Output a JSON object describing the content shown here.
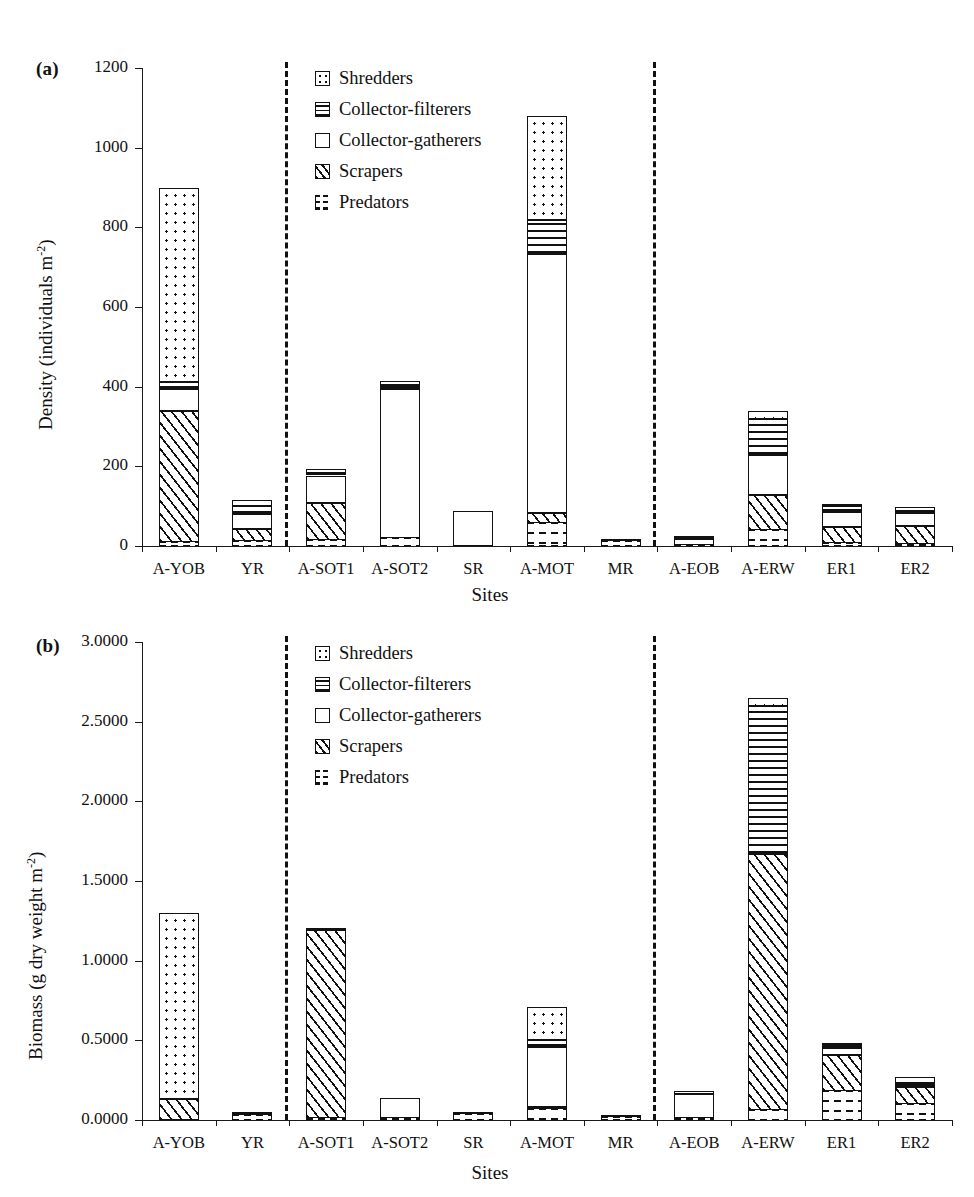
{
  "figure": {
    "panels": [
      {
        "letter": "(a)",
        "ylabel_main": "Density (individuals m",
        "ylabel_sup": "-2",
        "ylabel_close": ")",
        "xlabel": "Sites"
      },
      {
        "letter": "(b)",
        "ylabel_main": "Biomass (g dry weight m",
        "ylabel_sup": "-2",
        "ylabel_close": ")",
        "xlabel": "Sites"
      }
    ],
    "legend": [
      {
        "label": "Shredders",
        "key": "shredders",
        "pattern": "dots"
      },
      {
        "label": "Collector-filterers",
        "key": "filterers",
        "pattern": "horizontal-lines"
      },
      {
        "label": "Collector-gatherers",
        "key": "gatherers",
        "pattern": "blank"
      },
      {
        "label": "Scrapers",
        "key": "scrapers",
        "pattern": "diagonal-hatch"
      },
      {
        "label": "Predators",
        "key": "predators",
        "pattern": "dashes"
      }
    ]
  },
  "chart_data": [
    {
      "type": "bar",
      "subtype": "stacked",
      "panel": "(a)",
      "title": "",
      "xlabel": "Sites",
      "ylabel": "Density (individuals m-2)",
      "ylim": [
        0,
        1200
      ],
      "yticks": [
        0,
        200,
        400,
        600,
        800,
        1000,
        1200
      ],
      "ytick_labels": [
        "0",
        "200",
        "400",
        "600",
        "800",
        "1000",
        "1200"
      ],
      "grid": false,
      "legend_position": "top-center",
      "group_dividers_after": [
        "YR",
        "MR"
      ],
      "categories": [
        "A-YOB",
        "YR",
        "A-SOT1",
        "A-SOT2",
        "SR",
        "A-MOT",
        "MR",
        "A-EOB",
        "A-ERW",
        "ER1",
        "ER2"
      ],
      "series": [
        {
          "name": "Predators",
          "values": [
            10,
            12,
            14,
            20,
            0,
            58,
            12,
            2,
            40,
            8,
            6
          ]
        },
        {
          "name": "Scrapers",
          "values": [
            330,
            30,
            95,
            0,
            0,
            26,
            0,
            0,
            88,
            40,
            44
          ]
        },
        {
          "name": "Collector-gatherers",
          "values": [
            55,
            38,
            68,
            375,
            88,
            650,
            2,
            16,
            100,
            38,
            34
          ]
        },
        {
          "name": "Collector-filterers",
          "values": [
            18,
            20,
            6,
            10,
            0,
            85,
            0,
            2,
            90,
            14,
            4
          ]
        },
        {
          "name": "Shredders",
          "values": [
            487,
            16,
            10,
            10,
            0,
            261,
            0,
            6,
            20,
            2,
            10
          ]
        }
      ],
      "totals": [
        900,
        116,
        193,
        415,
        88,
        1080,
        14,
        26,
        338,
        100,
        98
      ]
    },
    {
      "type": "bar",
      "subtype": "stacked",
      "panel": "(b)",
      "title": "",
      "xlabel": "Sites",
      "ylabel": "Biomass (g dry weight m-2)",
      "ylim": [
        0,
        3.0
      ],
      "yticks": [
        0.0,
        0.5,
        1.0,
        1.5,
        2.0,
        2.5,
        3.0
      ],
      "ytick_labels": [
        "0.0000",
        "0.5000",
        "1.0000",
        "1.5000",
        "2.0000",
        "2.5000",
        "3.0000"
      ],
      "grid": false,
      "legend_position": "top-center",
      "group_dividers_after": [
        "YR",
        "MR"
      ],
      "categories": [
        "A-YOB",
        "YR",
        "A-SOT1",
        "A-SOT2",
        "SR",
        "A-MOT",
        "MR",
        "A-EOB",
        "A-ERW",
        "ER1",
        "ER2"
      ],
      "series": [
        {
          "name": "Predators",
          "values": [
            0.0,
            0.03,
            0.015,
            0.01,
            0.04,
            0.07,
            0.02,
            0.01,
            0.06,
            0.18,
            0.1
          ]
        },
        {
          "name": "Scrapers",
          "values": [
            0.13,
            0.005,
            1.175,
            0.0,
            0.0,
            0.01,
            0.0,
            0.0,
            1.61,
            0.23,
            0.11
          ]
        },
        {
          "name": "Collector-gatherers",
          "values": [
            0.0,
            0.005,
            0.005,
            0.13,
            0.01,
            0.38,
            0.005,
            0.155,
            0.0,
            0.04,
            0.01
          ]
        },
        {
          "name": "Collector-filterers",
          "values": [
            0.0,
            0.0,
            0.005,
            0.0,
            0.0,
            0.04,
            0.0,
            0.0,
            0.93,
            0.02,
            0.01
          ]
        },
        {
          "name": "Shredders",
          "values": [
            1.17,
            0.0,
            0.0,
            0.0,
            0.0,
            0.21,
            0.0,
            0.02,
            0.05,
            0.01,
            0.04
          ]
        }
      ],
      "totals": [
        1.3,
        0.04,
        1.2,
        0.14,
        0.05,
        0.71,
        0.025,
        0.185,
        2.65,
        0.48,
        0.27
      ]
    }
  ]
}
